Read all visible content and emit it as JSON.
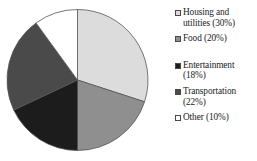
{
  "chart_data": {
    "type": "pie",
    "title": "",
    "subtitle": "",
    "xlabel": "",
    "ylabel": "",
    "grid": false,
    "legend_position": "right",
    "start_angle_deg": 0,
    "direction": "clockwise",
    "categories": [
      "Housing and utilities",
      "Food",
      "Entertainment",
      "Transportation",
      "Other"
    ],
    "values": [
      30,
      20,
      18,
      22,
      10
    ],
    "value_unit": "%",
    "colors": [
      "#dcdcdc",
      "#8f8f8f",
      "#1c1c1c",
      "#4a4a4a",
      "#ffffff"
    ],
    "slice_border_color": "#555555",
    "labels": [
      "Housing and utilities (30%)",
      "Food (20%)",
      "Entertainment (18%)",
      "Transportation (22%)",
      "Other (10%)"
    ]
  },
  "legend": {
    "entries": [
      {
        "label": "Housing and\nutilities (30%)",
        "color": "#dcdcdc"
      },
      {
        "label": "Food (20%)",
        "color": "#8f8f8f"
      },
      {
        "label": "Entertainment\n(18%)",
        "color": "#1c1c1c"
      },
      {
        "label": "Transportation\n(22%)",
        "color": "#4a4a4a"
      },
      {
        "label": "Other (10%)",
        "color": "#ffffff"
      }
    ]
  }
}
